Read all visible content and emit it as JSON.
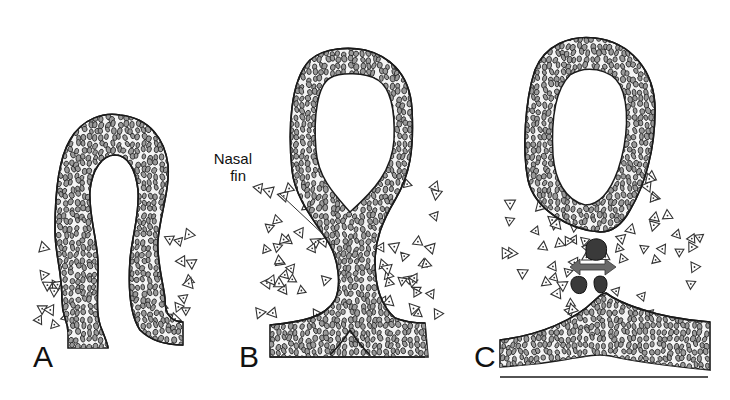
{
  "figure": {
    "panels": [
      {
        "id": "A",
        "label": "A",
        "stage": "invagination"
      },
      {
        "id": "B",
        "label": "B",
        "stage": "nasal-fin"
      },
      {
        "id": "C",
        "label": "C",
        "stage": "fin-breakdown"
      }
    ],
    "callout": {
      "text_line1": "Nasal",
      "text_line2": "fin"
    },
    "colors": {
      "outline": "#1a1a1a",
      "cell_fill": "#9a9a9a",
      "apoptotic_fill": "#3a3a3a",
      "arrow_fill": "#6a6a6a",
      "background": "#ffffff"
    }
  }
}
